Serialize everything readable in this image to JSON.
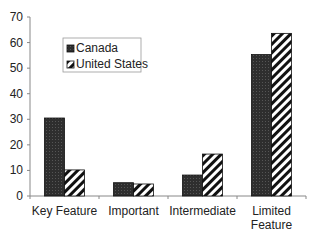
{
  "chart_data": {
    "type": "bar",
    "title": "",
    "xlabel": "",
    "ylabel": "",
    "categories": [
      "Key Feature",
      "Important",
      "Intermediate",
      "Limited Feature"
    ],
    "category_lines": [
      [
        "Key Feature"
      ],
      [
        "Important"
      ],
      [
        "Intermediate"
      ],
      [
        "Limited",
        "Feature"
      ]
    ],
    "series": [
      {
        "name": "Canada",
        "values": [
          30.5,
          5.2,
          8.2,
          55.3
        ],
        "fill": "#333333",
        "pattern": "dark-dotted"
      },
      {
        "name": "United States",
        "values": [
          10.2,
          4.7,
          16.4,
          63.6
        ],
        "fill": "#ffffff",
        "pattern": "diagonal-stripes"
      }
    ],
    "ylim": [
      0,
      70
    ],
    "yticks": [
      0,
      10,
      20,
      30,
      40,
      50,
      60,
      70
    ],
    "grid": false,
    "legend": {
      "position": "upper-left-inside",
      "entries": [
        "Canada",
        "United States"
      ]
    }
  }
}
